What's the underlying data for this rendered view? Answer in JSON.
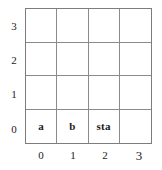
{
  "diagram": {
    "type": "grid-coordinate-plane",
    "grid": {
      "columns": 4,
      "rows": 4,
      "cells": [
        [
          {
            "label": "",
            "x": 0,
            "y": 3
          },
          {
            "label": "",
            "x": 1,
            "y": 3
          },
          {
            "label": "",
            "x": 2,
            "y": 3
          },
          {
            "label": "",
            "x": 3,
            "y": 3
          }
        ],
        [
          {
            "label": "",
            "x": 0,
            "y": 2
          },
          {
            "label": "",
            "x": 1,
            "y": 2
          },
          {
            "label": "",
            "x": 2,
            "y": 2
          },
          {
            "label": "",
            "x": 3,
            "y": 2
          }
        ],
        [
          {
            "label": "",
            "x": 0,
            "y": 1
          },
          {
            "label": "",
            "x": 1,
            "y": 1
          },
          {
            "label": "",
            "x": 2,
            "y": 1
          },
          {
            "label": "",
            "x": 3,
            "y": 1
          }
        ],
        [
          {
            "label": "a",
            "x": 0,
            "y": 0
          },
          {
            "label": "b",
            "x": 1,
            "y": 0
          },
          {
            "label": "sta",
            "x": 2,
            "y": 0
          },
          {
            "label": "",
            "x": 3,
            "y": 0
          }
        ]
      ]
    },
    "y_axis": {
      "ticks": [
        "3",
        "2",
        "1",
        "0"
      ]
    },
    "x_axis": {
      "ticks": [
        "0",
        "1",
        "2",
        "3"
      ]
    },
    "colors": {
      "grid_line": "#8a8a8a",
      "border": "#7c7c7c",
      "text": "#1a1a1a",
      "background": "#ffffff"
    }
  }
}
